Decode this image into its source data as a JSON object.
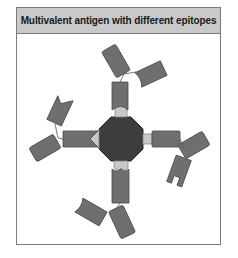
{
  "title": "Multivalent antigen with different epitopes",
  "colors": {
    "antibody_fill": "#6f6f6f",
    "antibody_stroke": "#4a4a4a",
    "antigen_fill": "#3d3d3d",
    "epitope_fill": "#c8c8c8",
    "header_fill": "#c9c9c9",
    "frame_stroke": "#7a7a7a"
  },
  "diagram": {
    "antigen": "multivalent-antigen",
    "epitopes": [
      "rounded-top",
      "notch-left",
      "square-right",
      "double-bump-bottom"
    ],
    "antibodies": [
      "antibody-top",
      "antibody-left",
      "antibody-right",
      "antibody-bottom"
    ]
  }
}
